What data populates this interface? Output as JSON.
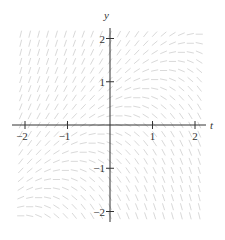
{
  "chart_data": {
    "type": "slope_field",
    "title": "",
    "xlabel": "t",
    "ylabel": "y",
    "xlim": [
      -2.2,
      2.2
    ],
    "ylim": [
      -2.2,
      2.2
    ],
    "x_ticks": [
      -2,
      -1,
      1,
      2
    ],
    "x_tick_labels": [
      "−2",
      "−1",
      "1",
      "2"
    ],
    "y_ticks": [
      -2,
      -1,
      1,
      2
    ],
    "y_tick_labels": [
      "−2",
      "−1",
      "1",
      "2"
    ],
    "grid": false,
    "field_samples": 21,
    "segment_color": "#d9d9d9",
    "axis_color": "#333333"
  }
}
